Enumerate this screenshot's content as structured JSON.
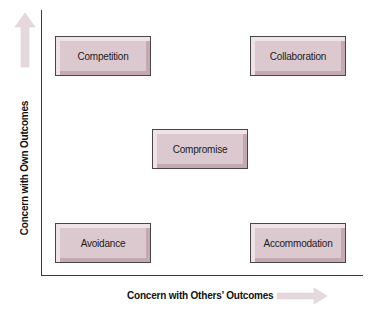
{
  "diagram": {
    "type": "conflict-styles-grid",
    "y_axis": {
      "label": "Concern with Own Outcomes",
      "arrow": "up-arrow"
    },
    "x_axis": {
      "label": "Concern with Others’ Outcomes",
      "arrow": "right-arrow"
    },
    "boxes": [
      {
        "label": "Competition",
        "position": "top-left"
      },
      {
        "label": "Collaboration",
        "position": "top-right"
      },
      {
        "label": "Compromise",
        "position": "center"
      },
      {
        "label": "Avoidance",
        "position": "bottom-left"
      },
      {
        "label": "Accommodation",
        "position": "bottom-right"
      }
    ],
    "colors": {
      "box_fill": "#dcc9cf",
      "box_highlight": "#efe3e7",
      "box_shadow": "#c3aab2",
      "box_border": "#4a4548",
      "arrow_fill": "#e6d9dd",
      "axis": "#3a3a3a"
    }
  }
}
